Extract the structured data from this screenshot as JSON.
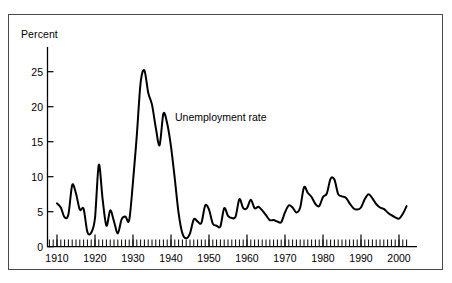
{
  "figure": {
    "background_color": "#ffffff",
    "frame_color": "#4a4a4a",
    "line_color": "#000000"
  },
  "axes": {
    "y_axis_title": "Percent",
    "y_ticks": [
      "0",
      "5",
      "10",
      "15",
      "20",
      "25"
    ],
    "x_ticks": [
      "1910",
      "1920",
      "1930",
      "1940",
      "1950",
      "1960",
      "1970",
      "1980",
      "1990",
      "2000"
    ]
  },
  "annotations": {
    "series_label": "Unemployment rate"
  },
  "chart_data": {
    "type": "line",
    "title": "",
    "subtitle": "",
    "xlabel": "",
    "ylabel": "Percent",
    "xlim": [
      1906,
      2003
    ],
    "ylim": [
      0,
      28
    ],
    "ytick_values": [
      0,
      5,
      10,
      15,
      20,
      25
    ],
    "xtick_values": [
      1910,
      1920,
      1930,
      1940,
      1950,
      1960,
      1970,
      1980,
      1990,
      2000
    ],
    "minor_tick_interval": 1,
    "grid": false,
    "legend": "inline-annotation",
    "legend_position": "inside-upper-center",
    "series": [
      {
        "name": "Unemployment rate",
        "x": [
          1910,
          1911,
          1912,
          1913,
          1914,
          1915,
          1916,
          1917,
          1918,
          1919,
          1920,
          1921,
          1922,
          1923,
          1924,
          1925,
          1926,
          1927,
          1928,
          1929,
          1930,
          1931,
          1932,
          1933,
          1934,
          1935,
          1936,
          1937,
          1938,
          1939,
          1940,
          1941,
          1942,
          1943,
          1944,
          1945,
          1946,
          1947,
          1948,
          1949,
          1950,
          1951,
          1952,
          1953,
          1954,
          1955,
          1956,
          1957,
          1958,
          1959,
          1960,
          1961,
          1962,
          1963,
          1964,
          1965,
          1966,
          1967,
          1968,
          1969,
          1970,
          1971,
          1972,
          1973,
          1974,
          1975,
          1976,
          1977,
          1978,
          1979,
          1980,
          1981,
          1982,
          1983,
          1984,
          1985,
          1986,
          1987,
          1988,
          1989,
          1990,
          1991,
          1992,
          1993,
          1994,
          1995,
          1996,
          1997,
          1998,
          1999,
          2000,
          2001,
          2002
        ],
        "values": [
          6.2,
          5.6,
          4.2,
          4.6,
          8.8,
          7.6,
          5.3,
          5.4,
          2.1,
          2.0,
          4.1,
          11.7,
          6.8,
          3.0,
          5.2,
          3.6,
          1.9,
          3.9,
          4.3,
          3.8,
          9.3,
          15.9,
          23.4,
          25.2,
          22.0,
          20.3,
          17.0,
          14.5,
          19.0,
          17.6,
          14.3,
          9.7,
          4.8,
          1.9,
          1.2,
          1.9,
          3.9,
          3.6,
          3.4,
          5.9,
          5.3,
          3.3,
          3.0,
          2.9,
          5.5,
          4.4,
          4.1,
          4.3,
          6.8,
          5.5,
          5.5,
          6.7,
          5.5,
          5.7,
          5.2,
          4.5,
          3.8,
          3.8,
          3.6,
          3.5,
          4.9,
          5.9,
          5.6,
          4.9,
          5.6,
          8.5,
          7.7,
          7.1,
          6.1,
          5.8,
          7.1,
          7.6,
          9.7,
          9.6,
          7.5,
          7.2,
          7.0,
          6.2,
          5.5,
          5.3,
          5.6,
          6.8,
          7.5,
          6.9,
          6.1,
          5.6,
          5.4,
          4.9,
          4.5,
          4.2,
          4.0,
          4.7,
          5.8
        ]
      }
    ]
  }
}
